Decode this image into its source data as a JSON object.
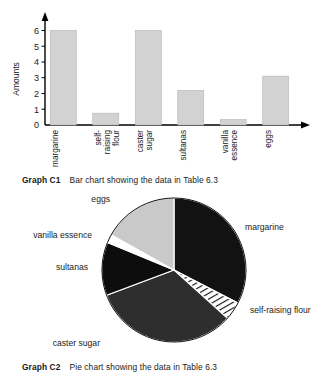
{
  "figures": {
    "bar": {
      "caption_id": "Graph C1",
      "caption_text": "Bar chart showing the data in Table 6.3"
    },
    "pie": {
      "caption_id": "Graph C2",
      "caption_text": "Pie chart showing the data in Table 6.3"
    }
  },
  "chart_data": [
    {
      "type": "bar",
      "title": "",
      "xlabel": "",
      "ylabel": "Amounts",
      "ylim": [
        0,
        6.6
      ],
      "yticks": [
        0,
        1,
        2,
        3,
        4,
        5,
        6
      ],
      "grid": false,
      "legend": "none",
      "bar_color": "#d2d2d2",
      "bar_edge_color": "#b4b4b4",
      "categories": [
        "margarine",
        "self-\nraising\nflour",
        "caster\nsugar",
        "sultanas",
        "vanilla\nessence",
        "eggs"
      ],
      "category_lines": [
        [
          "margarine"
        ],
        [
          "self-",
          "raising",
          "flour"
        ],
        [
          "caster",
          "sugar"
        ],
        [
          "sultanas"
        ],
        [
          "vanilla",
          "essence"
        ],
        [
          "eggs"
        ]
      ],
      "values": [
        6.0,
        0.75,
        6.0,
        2.2,
        0.35,
        3.1
      ]
    },
    {
      "type": "pie",
      "title": "",
      "legend": "outside-labels",
      "start_angle_deg": 0,
      "direction": "clockwise",
      "labels": [
        "margarine",
        "self-raising flour",
        "caster sugar",
        "sultanas",
        "vanilla essence",
        "eggs"
      ],
      "values": [
        6.0,
        0.75,
        6.0,
        2.2,
        0.35,
        3.1
      ],
      "percentages": [
        31.3,
        3.9,
        31.3,
        11.5,
        1.8,
        16.2
      ],
      "slice_colors": [
        "#121212",
        "#ffffff",
        "#2e2e2e",
        "#0d0d0d",
        "#ffffff",
        "#c9c9c9"
      ],
      "slice_patterns": [
        "solid",
        "diagonal-hatch",
        "solid",
        "solid",
        "solid",
        "solid"
      ]
    }
  ]
}
